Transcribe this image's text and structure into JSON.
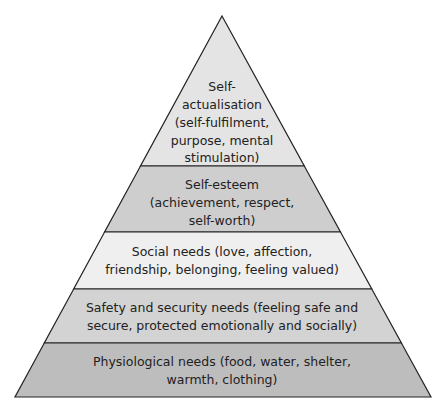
{
  "diagram": {
    "type": "pyramid",
    "apex": [
      222,
      16
    ],
    "base": {
      "left": [
        15,
        397
      ],
      "right": [
        431,
        397
      ]
    },
    "outline_color": "#222222",
    "text_color": "#222222",
    "levels": [
      {
        "id": "self-actualisation",
        "lines": [
          "Self-",
          "actualisation",
          "(self-fulfilment,",
          "purpose, mental",
          "stimulation)"
        ],
        "fill": "#e4e4e4",
        "y_top": 16,
        "y_bottom": 166
      },
      {
        "id": "self-esteem",
        "lines": [
          "Self-esteem",
          "(achievement, respect,",
          "self-worth)"
        ],
        "fill": "#cecece",
        "y_top": 166,
        "y_bottom": 232
      },
      {
        "id": "social-needs",
        "lines": [
          "Social needs (love, affection,",
          "friendship, belonging, feeling valued)"
        ],
        "fill": "#efefef",
        "y_top": 232,
        "y_bottom": 289
      },
      {
        "id": "safety-security-needs",
        "lines": [
          "Safety and security needs (feeling safe and",
          "secure, protected emotionally and socially)"
        ],
        "fill": "#d3d3d3",
        "y_top": 289,
        "y_bottom": 343
      },
      {
        "id": "physiological-needs",
        "lines": [
          "Physiological needs (food, water, shelter,",
          "warmth, clothing)"
        ],
        "fill": "#bdbdbd",
        "y_top": 343,
        "y_bottom": 397
      }
    ]
  }
}
